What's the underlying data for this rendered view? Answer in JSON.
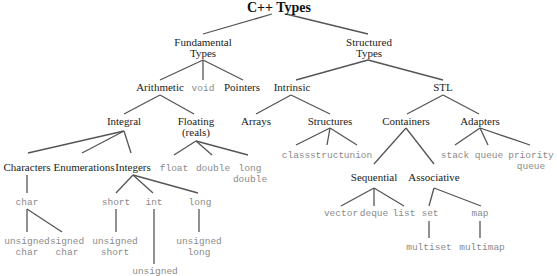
{
  "title": "C++ Types",
  "nodes": {
    "root": "C++ Types",
    "fundamental": "Fundamental Types",
    "fundamental_l1": "Fundamental",
    "fundamental_l2": "Types",
    "structured_l1": "Structured",
    "structured_l2": "Types",
    "arithmetic": "Arithmetic",
    "void": "void",
    "pointers": "Pointers",
    "intrinsic": "Intrinsic",
    "stl": "STL",
    "integral": "Integral",
    "floating_l1": "Floating",
    "floating_l2": "(reals)",
    "arrays": "Arrays",
    "structures": "Structures",
    "containers": "Containers",
    "adapters": "Adapters",
    "characters": "Characters",
    "enumerations": "Enumerations",
    "integers": "Integers",
    "float": "float",
    "double": "double",
    "long_double_l1": "long",
    "long_double_l2": "double",
    "class": "class",
    "struct": "struct",
    "union": "union",
    "sequential": "Sequential",
    "associative": "Associative",
    "stack": "stack",
    "queue": "queue",
    "priority_queue_l1": "priority",
    "priority_queue_l2": "queue",
    "char": "char",
    "short": "short",
    "int": "int",
    "long": "long",
    "vector": "vector",
    "deque": "deque",
    "list": "list",
    "set": "set",
    "map": "map",
    "unsigned_char_l1": "unsigned",
    "unsigned_char_l2": "char",
    "signed_char_l1": "signed",
    "signed_char_l2": "char",
    "unsigned_short_l1": "unsigned",
    "unsigned_short_l2": "short",
    "unsigned_int_l1": "unsigned",
    "unsigned_long_l1": "unsigned",
    "unsigned_long_l2": "long",
    "multiset": "multiset",
    "multimap": "multimap"
  },
  "colors": {
    "category_text": "#222222",
    "keyword_text": "#8a8a8a",
    "edge": "#555555"
  }
}
